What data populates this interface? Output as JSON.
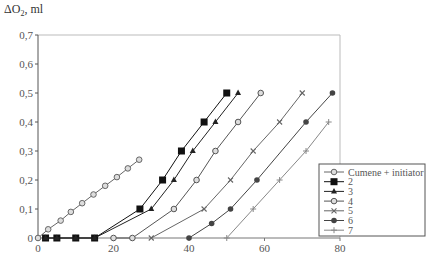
{
  "chart_data": {
    "type": "line",
    "title": "",
    "xlabel": "",
    "ylabel": "ΔO2, ml",
    "xlim": [
      0,
      80
    ],
    "ylim": [
      0,
      0.7
    ],
    "x_ticks": [
      "0",
      "20",
      "40",
      "60",
      "80"
    ],
    "y_ticks": [
      "0",
      "0,1",
      "0,2",
      "0,3",
      "0,4",
      "0,5",
      "0,6",
      "0,7"
    ],
    "grid": false,
    "legend_position": "lower right",
    "series": [
      {
        "name": "Cumene + initiator",
        "marker": "open-circle",
        "color": "#666666",
        "points": [
          [
            0,
            0
          ],
          [
            2.7,
            0.03
          ],
          [
            6,
            0.06
          ],
          [
            8.7,
            0.09
          ],
          [
            11.7,
            0.12
          ],
          [
            14.7,
            0.15
          ],
          [
            17.8,
            0.18
          ],
          [
            20.9,
            0.21
          ],
          [
            23.8,
            0.24
          ],
          [
            26.8,
            0.27
          ]
        ]
      },
      {
        "name": "2",
        "marker": "filled-square",
        "color": "#111111",
        "points": [
          [
            2,
            0
          ],
          [
            5,
            0
          ],
          [
            10,
            0
          ],
          [
            15,
            0
          ],
          [
            27,
            0.1
          ],
          [
            33,
            0.2
          ],
          [
            38,
            0.3
          ],
          [
            44,
            0.4
          ],
          [
            50,
            0.5
          ]
        ]
      },
      {
        "name": "3",
        "marker": "filled-triangle",
        "color": "#222222",
        "points": [
          [
            2,
            0
          ],
          [
            5,
            0
          ],
          [
            10,
            0
          ],
          [
            15,
            0
          ],
          [
            30,
            0.1
          ],
          [
            36,
            0.2
          ],
          [
            41,
            0.3
          ],
          [
            47,
            0.4
          ],
          [
            53,
            0.5
          ]
        ]
      },
      {
        "name": "4",
        "marker": "open-circle",
        "color": "#555555",
        "points": [
          [
            20,
            0
          ],
          [
            25,
            0
          ],
          [
            36,
            0.1
          ],
          [
            42,
            0.2
          ],
          [
            47,
            0.3
          ],
          [
            53,
            0.4
          ],
          [
            59,
            0.5
          ]
        ]
      },
      {
        "name": "5",
        "marker": "x",
        "color": "#666666",
        "points": [
          [
            30,
            0
          ],
          [
            44,
            0.1
          ],
          [
            51,
            0.2
          ],
          [
            57,
            0.3
          ],
          [
            64,
            0.4
          ],
          [
            70,
            0.5
          ]
        ]
      },
      {
        "name": "6",
        "marker": "filled-circle",
        "color": "#444444",
        "points": [
          [
            40,
            0
          ],
          [
            46,
            0.05
          ],
          [
            51,
            0.1
          ],
          [
            58,
            0.2
          ],
          [
            71,
            0.4
          ],
          [
            78,
            0.5
          ]
        ]
      },
      {
        "name": "7",
        "marker": "plus",
        "color": "#888888",
        "points": [
          [
            50,
            0
          ],
          [
            57,
            0.1
          ],
          [
            64,
            0.2
          ],
          [
            71,
            0.3
          ],
          [
            77,
            0.4
          ]
        ]
      }
    ]
  }
}
